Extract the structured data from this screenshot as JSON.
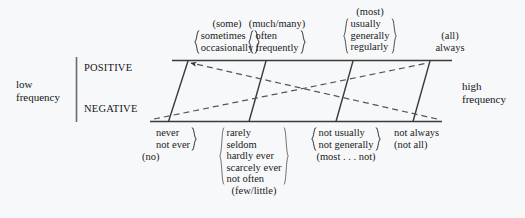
{
  "diagram": {
    "axis": {
      "left_label_line1": "low",
      "left_label_line2": "frequency",
      "right_label_line1": "high",
      "right_label_line2": "frequency"
    },
    "rows": {
      "positive": "POSITIVE",
      "negative": "NEGATIVE"
    },
    "positive_groups": [
      {
        "head": "(some)",
        "words": [
          "sometimes",
          "occasionally"
        ],
        "braced": true,
        "foot": ""
      },
      {
        "head": "(much/many)",
        "words": [
          "often",
          "frequently"
        ],
        "braced": true,
        "foot": ""
      },
      {
        "head": "(most)",
        "words": [
          "usually",
          "generally",
          "regularly"
        ],
        "braced": true,
        "foot": ""
      },
      {
        "head": "(all)",
        "words": [
          "always"
        ],
        "braced": false,
        "foot": ""
      }
    ],
    "negative_groups": [
      {
        "words": [
          "never",
          "not ever"
        ],
        "braced": true,
        "foot": "(no)"
      },
      {
        "words": [
          "rarely",
          "seldom",
          "hardly ever",
          "scarcely ever",
          "not often"
        ],
        "braced": true,
        "foot": "(few/little)"
      },
      {
        "words": [
          "not usually",
          "not generally"
        ],
        "braced": true,
        "foot": "(most . . . not)"
      },
      {
        "words": [
          "not always"
        ],
        "braced": false,
        "foot": "(not all)"
      }
    ],
    "colors": {
      "background": "#f7f8f9",
      "ink": "#15161a",
      "rule": "#3a3a3a",
      "dashed": "#55565a"
    }
  }
}
